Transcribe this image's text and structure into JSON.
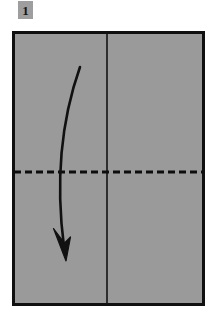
{
  "figure": {
    "caption": "Fold the top half down along the dashed horizontal crease.",
    "step_number": "1",
    "badge": {
      "label": "1",
      "background_color": "#9e9e9e",
      "text_color": "#141414"
    },
    "background_color": "#ffffff",
    "paper": {
      "name": "paper-sheet",
      "fill_color": "#9a9a9a",
      "stroke_color": "#101010",
      "stroke_width": 3,
      "x": 12,
      "y": 31,
      "width": 193,
      "height": 275
    },
    "lines": [
      {
        "name": "vertical-center-crease",
        "style": "solid",
        "meaning": "existing crease",
        "color": "#141414",
        "stroke_width": 1.6,
        "x1": 107,
        "y1": 32,
        "x2": 107,
        "y2": 305
      },
      {
        "name": "horizontal-fold-line",
        "style": "dashed",
        "meaning": "valley fold line",
        "color": "#0d0d0d",
        "stroke_width": 3,
        "dash_length": 7,
        "gap_length": 4,
        "x1": 13,
        "y1": 172,
        "x2": 204,
        "y2": 172
      }
    ],
    "arrow": {
      "name": "fold-direction-arrow",
      "meaning": "fold downward",
      "color": "#111111",
      "stroke_width": 2.6,
      "start": {
        "x": 80,
        "y": 67
      },
      "control_1": {
        "x": 62,
        "y": 118
      },
      "control_2": {
        "x": 55,
        "y": 178
      },
      "end": {
        "x": 64,
        "y": 247
      },
      "head": {
        "tip": {
          "x": 66,
          "y": 261
        },
        "left_barb": {
          "x": 54,
          "y": 229
        },
        "right_barb": {
          "x": 70,
          "y": 238
        }
      }
    }
  }
}
